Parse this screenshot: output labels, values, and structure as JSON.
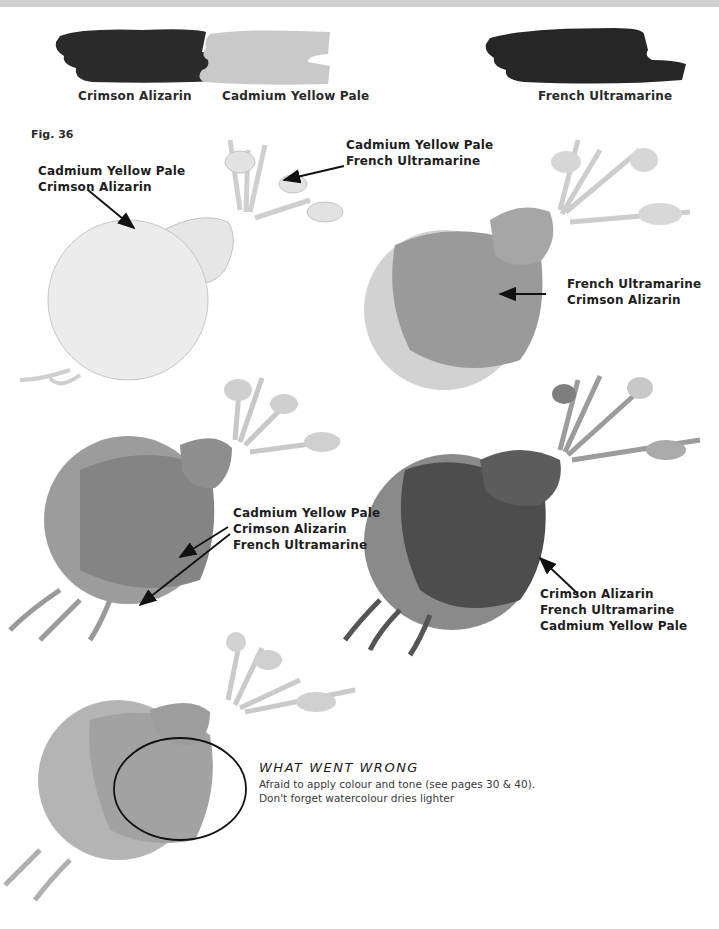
{
  "swatches": [
    {
      "label": "Crimson Alizarin",
      "color": "#2b2b2b"
    },
    {
      "label": "Cadmium Yellow Pale",
      "color": "#c9c9c9"
    },
    {
      "label": "French Ultramarine",
      "color": "#262626"
    }
  ],
  "figure": {
    "label": "Fig. 36"
  },
  "callouts": {
    "stage1_body": {
      "lines": [
        "Cadmium Yellow Pale",
        "Crimson Alizarin"
      ]
    },
    "stage1_leaves": {
      "lines": [
        "Cadmium Yellow Pale",
        "French Ultramarine"
      ]
    },
    "stage2_body": {
      "lines": [
        "French Ultramarine",
        "Crimson Alizarin"
      ]
    },
    "stage3_body": {
      "lines": [
        "Cadmium Yellow Pale",
        "Crimson Alizarin",
        "French Ultramarine"
      ]
    },
    "stage4_body": {
      "lines": [
        "Crimson Alizarin",
        "French Ultramarine",
        "Cadmium Yellow Pale"
      ]
    }
  },
  "what_went_wrong": {
    "title": "WHAT WENT WRONG",
    "lines": [
      "Afraid to apply colour and tone (see pages 30 & 40).",
      "Don't forget watercolour dries lighter"
    ]
  },
  "colors": {
    "top_band": "#cfcfcf",
    "stage1_fill": "#ebebeb",
    "stage2_fill": "#9a9a9a",
    "stage3_fill": "#8c8c8c",
    "stage4_fill": "#5a5a5a",
    "stage5_fill": "#a8a8a8"
  }
}
